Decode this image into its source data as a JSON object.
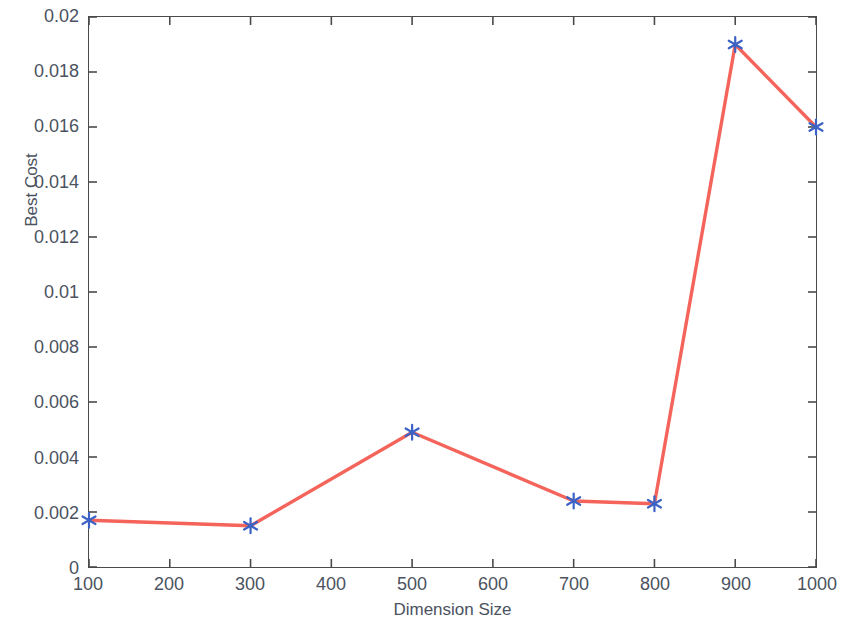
{
  "chart_data": {
    "type": "line",
    "title": "",
    "xlabel": "Dimension Size",
    "ylabel": "Best Cost",
    "x": [
      100,
      300,
      500,
      700,
      800,
      900,
      1000
    ],
    "values": [
      0.0017,
      0.0015,
      0.0049,
      0.0024,
      0.0023,
      0.019,
      0.016
    ],
    "series": [
      {
        "name": "Best Cost",
        "x": [
          100,
          300,
          500,
          700,
          800,
          900,
          1000
        ],
        "values": [
          0.0017,
          0.0015,
          0.0049,
          0.0024,
          0.0023,
          0.019,
          0.016
        ],
        "line_color": "#F4645A",
        "marker": "asterisk",
        "marker_color": "#3B62C4"
      }
    ],
    "xlim": [
      100,
      1000
    ],
    "ylim": [
      0,
      0.02
    ],
    "xticks": [
      100,
      200,
      300,
      400,
      500,
      600,
      700,
      800,
      900,
      1000
    ],
    "xtick_labels": [
      "100",
      "200",
      "300",
      "400",
      "500",
      "600",
      "700",
      "800",
      "900",
      "1000"
    ],
    "yticks": [
      0,
      0.002,
      0.004,
      0.006,
      0.008,
      0.01,
      0.012,
      0.014,
      0.016,
      0.018,
      0.02
    ],
    "ytick_labels": [
      "0",
      "0.002",
      "0.004",
      "0.006",
      "0.008",
      "0.01",
      "0.012",
      "0.014",
      "0.016",
      "0.018",
      "0.02"
    ],
    "grid": false,
    "legend": null,
    "legend_position": "none",
    "background_color": "#FFFFFF",
    "axis_color": "#4A4A4A",
    "tick_direction": "in",
    "box": true
  }
}
